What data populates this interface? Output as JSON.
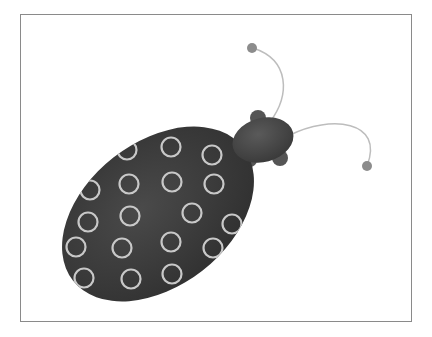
{
  "scene": {
    "subject": "ladybug",
    "frame": {
      "x": 20,
      "y": 14,
      "width": 392,
      "height": 308,
      "border_color": "#8a8a8a"
    },
    "colors": {
      "body": "#3e3e3e",
      "body_edge": "#2c2c2c",
      "head": "#4a4a4a",
      "spot_ring": "#c8c8c8",
      "antenna": "#bdbdbd",
      "antenna_tip": "#8c8c8c"
    },
    "body": {
      "cx": 158,
      "cy": 214,
      "rx": 108,
      "ry": 72,
      "rotate": -38
    },
    "head": {
      "cx": 263,
      "cy": 140,
      "rx": 31,
      "ry": 22,
      "rotate": -15
    },
    "legs": [
      {
        "cx": 258,
        "cy": 118,
        "r": 8
      },
      {
        "cx": 280,
        "cy": 158,
        "r": 8
      },
      {
        "cx": 250,
        "cy": 160,
        "r": 7
      }
    ],
    "antennae": [
      {
        "path": "M 270 122 C 290 95, 290 60, 253 48",
        "tip": {
          "cx": 252,
          "cy": 48,
          "r": 5
        }
      },
      {
        "path": "M 290 135 C 330 115, 385 120, 367 166",
        "tip": {
          "cx": 367,
          "cy": 166,
          "r": 5
        }
      }
    ],
    "spots": [
      {
        "cx": 171,
        "cy": 147
      },
      {
        "cx": 212,
        "cy": 155
      },
      {
        "cx": 129,
        "cy": 184
      },
      {
        "cx": 172,
        "cy": 182
      },
      {
        "cx": 214,
        "cy": 184
      },
      {
        "cx": 130,
        "cy": 216
      },
      {
        "cx": 192,
        "cy": 213
      },
      {
        "cx": 232,
        "cy": 224
      },
      {
        "cx": 88,
        "cy": 222
      },
      {
        "cx": 122,
        "cy": 248
      },
      {
        "cx": 171,
        "cy": 242
      },
      {
        "cx": 213,
        "cy": 248
      },
      {
        "cx": 76,
        "cy": 247
      },
      {
        "cx": 131,
        "cy": 279
      },
      {
        "cx": 172,
        "cy": 274
      },
      {
        "cx": 84,
        "cy": 278
      },
      {
        "cx": 127,
        "cy": 150
      },
      {
        "cx": 90,
        "cy": 190
      }
    ],
    "spot_radius": 9.5
  }
}
